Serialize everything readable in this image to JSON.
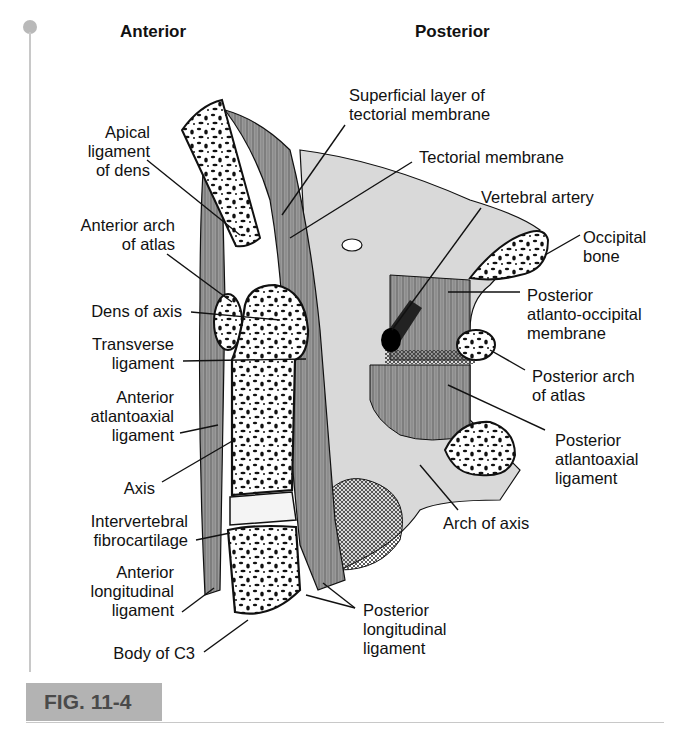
{
  "figure": {
    "tag": "FIG. 11-4",
    "orientation_labels": {
      "left": "Anterior",
      "right": "Posterior"
    },
    "labels_left": [
      {
        "id": "apical-ligament",
        "text": "Apical\nligament\nof dens"
      },
      {
        "id": "anterior-arch-atlas",
        "text": "Anterior arch\nof atlas"
      },
      {
        "id": "dens-of-axis",
        "text": "Dens of axis"
      },
      {
        "id": "transverse-ligament",
        "text": "Transverse\nligament"
      },
      {
        "id": "anterior-atlantoaxial-ligament",
        "text": "Anterior\natlantoaxial\nligament"
      },
      {
        "id": "axis",
        "text": "Axis"
      },
      {
        "id": "intervertebral-fibrocartilage",
        "text": "Intervertebral\nfibrocartilage"
      },
      {
        "id": "anterior-longitudinal-ligament",
        "text": "Anterior\nlongitudinal\nligament"
      },
      {
        "id": "body-of-c3",
        "text": "Body of C3"
      }
    ],
    "labels_right": [
      {
        "id": "superficial-tectorial",
        "text": "Superficial layer of\ntectorial membrane"
      },
      {
        "id": "tectorial-membrane",
        "text": "Tectorial membrane"
      },
      {
        "id": "vertebral-artery",
        "text": "Vertebral artery"
      },
      {
        "id": "occipital-bone",
        "text": "Occipital\nbone"
      },
      {
        "id": "posterior-atlanto-occipital",
        "text": "Posterior\natlanto-occipital\nmembrane"
      },
      {
        "id": "posterior-arch-atlas",
        "text": "Posterior arch\nof atlas"
      },
      {
        "id": "posterior-atlantoaxial",
        "text": "Posterior\natlantoaxial\nligament"
      },
      {
        "id": "arch-of-axis",
        "text": "Arch of axis"
      },
      {
        "id": "posterior-longitudinal",
        "text": "Posterior\nlongitudinal\nligament"
      }
    ]
  },
  "colors": {
    "ligament_gray": "#8a8a8a",
    "bone_white": "#ffffff",
    "outline": "#111111",
    "tag_bg": "#b3b3b3",
    "tag_text": "#4a4a4a",
    "frame": "#c8c8c8"
  }
}
